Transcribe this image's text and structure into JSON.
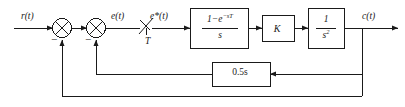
{
  "diagram": {
    "type": "control-block-diagram",
    "stroke_color": "#1a1a1a",
    "background": "#ffffff",
    "signals": {
      "input": "r(t)",
      "error": "e(t)",
      "sampled_error": "e*(t)",
      "output": "c(t)",
      "sampling_period": "T"
    },
    "blocks": {
      "zero_order_hold": {
        "numerator": "1−e−sT",
        "numerator_base": "1−e",
        "numerator_exponent": "−sT",
        "denominator": "s",
        "label": "(1−e^(−sT))/s"
      },
      "gain": {
        "label": "K"
      },
      "plant": {
        "numerator": "1",
        "denominator_base": "s",
        "denominator_exponent": "2",
        "denominator": "s2",
        "label": "1/s²"
      },
      "inner_feedback": {
        "label": "0.5s"
      }
    },
    "summing_junctions": [
      {
        "name": "outer-sum",
        "symbol": "⊗",
        "sign": "−"
      },
      {
        "name": "inner-sum",
        "symbol": "⊗",
        "sign": "−"
      }
    ],
    "sampler": {
      "name": "sampler-switch",
      "period_label": "T"
    }
  }
}
